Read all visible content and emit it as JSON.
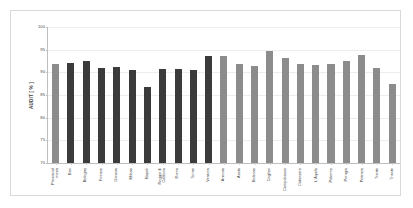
{
  "chart_data": {
    "type": "bar",
    "title": "",
    "subtitle": "",
    "xlabel": "",
    "ylabel": "AUDIT [ % ]",
    "ylim": [
      70,
      100
    ],
    "yticks": [
      70,
      75,
      80,
      85,
      90,
      95,
      100
    ],
    "ytick_labels": [
      "70",
      "75",
      "80",
      "85",
      "90",
      "95",
      "100"
    ],
    "grid": true,
    "legend": "none",
    "categories": [
      "Provincial mean",
      "Bari",
      "Bologna",
      "Firenze",
      "Genova",
      "Milano",
      "Napoli",
      "Reggio di Calabria",
      "Roma",
      "Torino",
      "Venezia",
      "Ancona",
      "Aosta",
      "Bolzano",
      "Cagliari",
      "Campobasso",
      "Catanzaro",
      "L'Aquila",
      "Palermo",
      "Perugia",
      "Potenza",
      "Trento",
      "Trieste"
    ],
    "category_lines": [
      "Provincial\nmean",
      "Bari",
      "Bologna",
      "Firenze",
      "Genova",
      "Milano",
      "Napoli",
      "Reggio di\nCalabria",
      "Roma",
      "Torino",
      "Venezia",
      "Ancona",
      "Aosta",
      "Bolzano",
      "Cagliari",
      "Campobasso",
      "Catanzaro",
      "L'Aquila",
      "Palermo",
      "Perugia",
      "Potenza",
      "Trento",
      "Trieste"
    ],
    "values": [
      91.8,
      92.0,
      92.4,
      90.9,
      91.1,
      90.6,
      86.7,
      90.7,
      90.8,
      90.6,
      93.7,
      93.5,
      91.8,
      91.5,
      94.7,
      93.2,
      91.8,
      91.7,
      91.8,
      92.5,
      93.9,
      90.9,
      87.4
    ],
    "bar_colors": [
      "#8c8c8c",
      "#3b3b3b",
      "#3b3b3b",
      "#3b3b3b",
      "#3b3b3b",
      "#3b3b3b",
      "#3b3b3b",
      "#3b3b3b",
      "#3b3b3b",
      "#3b3b3b",
      "#3b3b3b",
      "#8c8c8c",
      "#8c8c8c",
      "#8c8c8c",
      "#8c8c8c",
      "#8c8c8c",
      "#8c8c8c",
      "#8c8c8c",
      "#8c8c8c",
      "#8c8c8c",
      "#8c8c8c",
      "#8c8c8c",
      "#8c8c8c"
    ],
    "colors": {
      "metropolitan_bar": "#3b3b3b",
      "provincial_bar": "#8c8c8c",
      "axis": "#bfbfbf",
      "gridline": "#ededed",
      "frame": "#d9d9d9",
      "background": "#ffffff",
      "text": "#444444"
    }
  }
}
